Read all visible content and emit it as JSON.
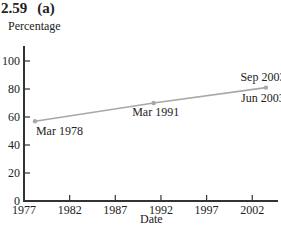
{
  "figure": {
    "number": "2.59",
    "part": "(a)"
  },
  "chart_data": {
    "type": "line",
    "xlabel": "Date",
    "ylabel": "Percentage",
    "xlim": [
      1977,
      2004
    ],
    "ylim": [
      0,
      105
    ],
    "x_ticks": [
      1977,
      1982,
      1987,
      1992,
      1997,
      2002
    ],
    "y_ticks": [
      0,
      20,
      40,
      60,
      80,
      100
    ],
    "grid": false,
    "legend": null,
    "series": [
      {
        "name": "Percentage",
        "color": "#a8a8a8",
        "points": [
          {
            "x": 1978.2,
            "y": 57,
            "label": "Mar 1978"
          },
          {
            "x": 1991.2,
            "y": 70,
            "label": "Mar 1991"
          },
          {
            "x": 2003.5,
            "y": 81,
            "label": "Sep 2003 / Jun 2003"
          }
        ]
      }
    ],
    "annotations": [
      {
        "text": "Mar 1978",
        "at": "point-1",
        "position": "below-right"
      },
      {
        "text": "Mar 1991",
        "at": "point-2",
        "position": "below"
      },
      {
        "text": "Sep 2003",
        "at": "point-3",
        "position": "above"
      },
      {
        "text": "Jun 2003",
        "at": "point-3",
        "position": "below"
      }
    ]
  },
  "labels": {
    "x_ticks": [
      "1977",
      "1982",
      "1987",
      "1992",
      "1997",
      "2002"
    ],
    "y_ticks": [
      "0",
      "20",
      "40",
      "60",
      "80",
      "100"
    ],
    "annotations": [
      "Mar 1978",
      "Mar 1991",
      "Sep 2003",
      "Jun 2003"
    ]
  }
}
